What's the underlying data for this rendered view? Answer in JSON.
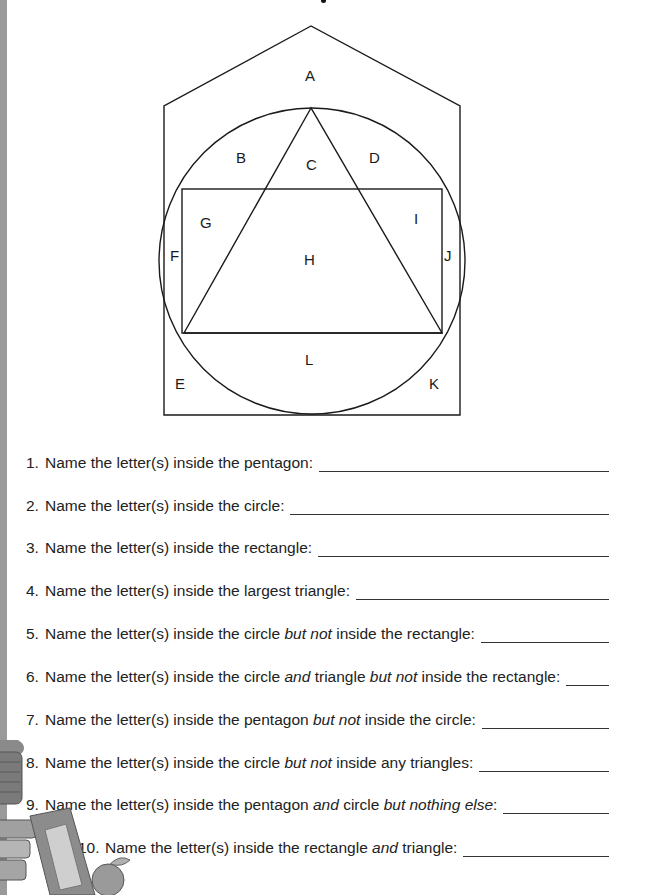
{
  "figure": {
    "shapes": [
      "pentagon",
      "circle",
      "rectangle",
      "triangle"
    ],
    "region_labels": [
      "A",
      "B",
      "C",
      "D",
      "E",
      "F",
      "G",
      "H",
      "I",
      "J",
      "K",
      "L"
    ]
  },
  "questions": [
    {
      "num": "1.",
      "parts": [
        {
          "t": "Name the letter(s) inside the pentagon:",
          "i": false
        }
      ]
    },
    {
      "num": "2.",
      "parts": [
        {
          "t": "Name the letter(s) inside the circle:",
          "i": false
        }
      ]
    },
    {
      "num": "3.",
      "parts": [
        {
          "t": "Name the letter(s) inside the rectangle:",
          "i": false
        }
      ]
    },
    {
      "num": "4.",
      "parts": [
        {
          "t": "Name the letter(s) inside the largest triangle:",
          "i": false
        }
      ]
    },
    {
      "num": "5.",
      "parts": [
        {
          "t": "Name the letter(s) inside the circle ",
          "i": false
        },
        {
          "t": "but not",
          "i": true
        },
        {
          "t": " inside the rectangle:",
          "i": false
        }
      ]
    },
    {
      "num": "6.",
      "parts": [
        {
          "t": "Name the letter(s) inside the circle ",
          "i": false
        },
        {
          "t": "and",
          "i": true
        },
        {
          "t": " triangle ",
          "i": false
        },
        {
          "t": "but not",
          "i": true
        },
        {
          "t": " inside the rectangle:",
          "i": false
        }
      ]
    },
    {
      "num": "7.",
      "parts": [
        {
          "t": "Name the letter(s) inside the pentagon ",
          "i": false
        },
        {
          "t": "but not",
          "i": true
        },
        {
          "t": " inside the circle:",
          "i": false
        }
      ]
    },
    {
      "num": "8.",
      "parts": [
        {
          "t": "Name the letter(s) inside the circle ",
          "i": false
        },
        {
          "t": "but not",
          "i": true
        },
        {
          "t": " inside any triangles:",
          "i": false
        }
      ]
    },
    {
      "num": "9.",
      "parts": [
        {
          "t": "Name the letter(s) inside the pentagon ",
          "i": false
        },
        {
          "t": "and",
          "i": true
        },
        {
          "t": " circle ",
          "i": false
        },
        {
          "t": "but nothing else",
          "i": true
        },
        {
          "t": ":",
          "i": false
        }
      ]
    },
    {
      "num": "10.",
      "parts": [
        {
          "t": "Name the letter(s) inside the rectangle ",
          "i": false
        },
        {
          "t": "and",
          "i": true
        },
        {
          "t": " triangle:",
          "i": false
        }
      ]
    }
  ],
  "answers": [
    "",
    "",
    "",
    "",
    "",
    "",
    "",
    "",
    "",
    ""
  ]
}
